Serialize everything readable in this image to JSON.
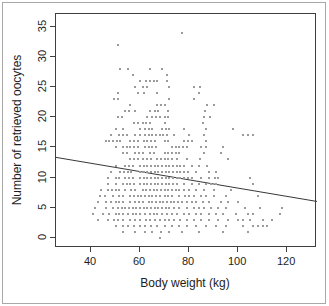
{
  "chart_data": {
    "type": "scatter",
    "title": "",
    "xlabel": "Body weight (kg)",
    "ylabel": "Number of retrieved oocytes",
    "xlim": [
      25.7,
      132.2
    ],
    "ylim": [
      -1.66,
      37.1
    ],
    "x_ticks": [
      40,
      60,
      80,
      100,
      120
    ],
    "y_ticks": [
      0,
      5,
      10,
      15,
      20,
      25,
      30,
      35
    ],
    "grid": false,
    "legend": "none",
    "point_color": "#9b9b9b",
    "trend_color": "#383838",
    "axis_color": "#3f3f3f",
    "frame_color": "#a8a8a8",
    "trend_line": {
      "x": [
        25.7,
        132.2
      ],
      "y": [
        13.35,
        6.05
      ]
    },
    "points": [
      [
        77,
        34
      ],
      [
        51,
        32
      ],
      [
        52,
        28
      ],
      [
        55,
        28
      ],
      [
        64,
        28
      ],
      [
        69,
        28
      ],
      [
        57,
        27
      ],
      [
        71,
        27
      ],
      [
        60,
        26
      ],
      [
        62.5,
        26
      ],
      [
        64,
        26
      ],
      [
        65.5,
        26
      ],
      [
        67,
        26
      ],
      [
        71,
        26
      ],
      [
        58,
        25
      ],
      [
        61,
        25
      ],
      [
        63,
        25
      ],
      [
        72,
        25
      ],
      [
        82,
        25
      ],
      [
        84.5,
        25
      ],
      [
        51,
        24
      ],
      [
        59,
        24
      ],
      [
        61.5,
        24
      ],
      [
        67,
        24
      ],
      [
        84,
        24
      ],
      [
        49.5,
        23
      ],
      [
        51,
        23
      ],
      [
        72,
        23
      ],
      [
        82,
        23
      ],
      [
        56,
        22
      ],
      [
        67,
        22
      ],
      [
        68.5,
        22
      ],
      [
        70,
        22
      ],
      [
        87.5,
        22
      ],
      [
        90,
        22
      ],
      [
        54,
        21
      ],
      [
        55.5,
        21
      ],
      [
        58,
        21
      ],
      [
        64,
        21
      ],
      [
        66,
        21
      ],
      [
        67.5,
        21
      ],
      [
        71.5,
        21
      ],
      [
        86.5,
        21
      ],
      [
        51,
        20
      ],
      [
        52.5,
        20
      ],
      [
        63,
        20
      ],
      [
        65,
        20
      ],
      [
        66.5,
        20
      ],
      [
        68,
        20
      ],
      [
        70,
        20
      ],
      [
        71.5,
        20
      ],
      [
        86,
        20
      ],
      [
        88.5,
        20
      ],
      [
        57.5,
        19
      ],
      [
        59,
        19
      ],
      [
        61,
        19
      ],
      [
        62.5,
        19
      ],
      [
        64,
        19
      ],
      [
        70,
        19
      ],
      [
        85.5,
        19
      ],
      [
        50,
        18
      ],
      [
        53,
        18
      ],
      [
        60,
        18
      ],
      [
        62,
        18
      ],
      [
        63.5,
        18
      ],
      [
        65,
        18
      ],
      [
        69,
        18
      ],
      [
        70.5,
        18
      ],
      [
        72,
        18
      ],
      [
        78,
        18
      ],
      [
        87,
        18
      ],
      [
        98,
        18
      ],
      [
        48,
        17
      ],
      [
        51.5,
        17
      ],
      [
        53,
        17
      ],
      [
        54.5,
        17
      ],
      [
        58,
        17
      ],
      [
        60,
        17
      ],
      [
        62,
        17
      ],
      [
        63.5,
        17
      ],
      [
        65,
        17
      ],
      [
        66.5,
        17
      ],
      [
        68,
        17
      ],
      [
        69.5,
        17
      ],
      [
        71,
        17
      ],
      [
        74,
        17
      ],
      [
        80,
        17
      ],
      [
        86,
        17
      ],
      [
        102,
        17
      ],
      [
        104,
        17
      ],
      [
        106,
        17
      ],
      [
        46,
        16
      ],
      [
        47.5,
        16
      ],
      [
        49,
        16
      ],
      [
        50.5,
        16
      ],
      [
        52,
        16
      ],
      [
        56,
        16
      ],
      [
        57.5,
        16
      ],
      [
        59,
        16
      ],
      [
        61.5,
        16
      ],
      [
        63,
        16
      ],
      [
        64.5,
        16
      ],
      [
        66,
        16
      ],
      [
        70,
        16
      ],
      [
        71.5,
        16
      ],
      [
        78,
        16
      ],
      [
        79.5,
        16
      ],
      [
        81,
        16
      ],
      [
        87,
        16
      ],
      [
        50,
        15
      ],
      [
        53,
        15
      ],
      [
        54.5,
        15
      ],
      [
        56,
        15
      ],
      [
        57.5,
        15
      ],
      [
        59,
        15
      ],
      [
        62,
        15
      ],
      [
        63.5,
        15
      ],
      [
        65,
        15
      ],
      [
        66.5,
        15
      ],
      [
        73,
        15
      ],
      [
        74.5,
        15
      ],
      [
        76,
        15
      ],
      [
        77.5,
        15
      ],
      [
        79,
        15
      ],
      [
        85,
        15
      ],
      [
        87,
        15
      ],
      [
        94,
        15
      ],
      [
        53,
        14
      ],
      [
        54.5,
        14
      ],
      [
        58,
        14
      ],
      [
        59.5,
        14
      ],
      [
        61,
        14
      ],
      [
        64,
        14
      ],
      [
        65.5,
        14
      ],
      [
        70,
        14
      ],
      [
        71.5,
        14
      ],
      [
        73,
        14
      ],
      [
        74.5,
        14
      ],
      [
        76,
        14
      ],
      [
        86,
        14
      ],
      [
        93,
        14
      ],
      [
        56,
        13
      ],
      [
        57.5,
        13
      ],
      [
        59,
        13
      ],
      [
        61,
        13
      ],
      [
        63,
        13
      ],
      [
        64.5,
        13
      ],
      [
        67,
        13
      ],
      [
        68.5,
        13
      ],
      [
        70,
        13
      ],
      [
        71.5,
        13
      ],
      [
        73,
        13
      ],
      [
        75,
        13
      ],
      [
        79,
        13
      ],
      [
        84.5,
        13
      ],
      [
        96,
        13
      ],
      [
        50,
        12
      ],
      [
        54,
        12
      ],
      [
        55.5,
        12
      ],
      [
        57,
        12
      ],
      [
        60,
        12
      ],
      [
        61.5,
        12
      ],
      [
        63,
        12
      ],
      [
        64.5,
        12
      ],
      [
        66,
        12
      ],
      [
        67.5,
        12
      ],
      [
        69,
        12
      ],
      [
        70.5,
        12
      ],
      [
        72,
        12
      ],
      [
        73.5,
        12
      ],
      [
        75,
        12
      ],
      [
        76.5,
        12
      ],
      [
        78,
        12
      ],
      [
        81,
        12
      ],
      [
        84,
        12
      ],
      [
        87.5,
        12
      ],
      [
        48,
        11
      ],
      [
        52,
        11
      ],
      [
        53.5,
        11
      ],
      [
        55,
        11
      ],
      [
        56.5,
        11
      ],
      [
        60,
        11
      ],
      [
        61.5,
        11
      ],
      [
        63,
        11
      ],
      [
        64.5,
        11
      ],
      [
        66,
        11
      ],
      [
        67.5,
        11
      ],
      [
        69,
        11
      ],
      [
        70.5,
        11
      ],
      [
        72,
        11
      ],
      [
        73.5,
        11
      ],
      [
        75,
        11
      ],
      [
        76.5,
        11
      ],
      [
        78,
        11
      ],
      [
        79.5,
        11
      ],
      [
        83,
        11
      ],
      [
        88,
        11
      ],
      [
        91,
        11
      ],
      [
        47,
        10
      ],
      [
        50,
        10
      ],
      [
        51.5,
        10
      ],
      [
        54,
        10
      ],
      [
        55.5,
        10
      ],
      [
        57,
        10
      ],
      [
        60,
        10
      ],
      [
        61.5,
        10
      ],
      [
        63,
        10
      ],
      [
        64.5,
        10
      ],
      [
        66,
        10
      ],
      [
        67.5,
        10
      ],
      [
        69,
        10
      ],
      [
        70.5,
        10
      ],
      [
        72,
        10
      ],
      [
        73.5,
        10
      ],
      [
        75,
        10
      ],
      [
        76.5,
        10
      ],
      [
        78,
        10
      ],
      [
        79.5,
        10
      ],
      [
        81,
        10
      ],
      [
        85,
        10
      ],
      [
        88,
        10
      ],
      [
        90.5,
        10
      ],
      [
        92,
        10
      ],
      [
        105,
        10
      ],
      [
        47,
        9
      ],
      [
        50,
        9
      ],
      [
        53,
        9
      ],
      [
        54.5,
        9
      ],
      [
        56,
        9
      ],
      [
        57.5,
        9
      ],
      [
        60,
        9
      ],
      [
        61.5,
        9
      ],
      [
        63,
        9
      ],
      [
        64.5,
        9
      ],
      [
        66,
        9
      ],
      [
        67.5,
        9
      ],
      [
        69,
        9
      ],
      [
        70.5,
        9
      ],
      [
        72,
        9
      ],
      [
        73.5,
        9
      ],
      [
        75,
        9
      ],
      [
        78,
        9
      ],
      [
        81,
        9
      ],
      [
        84,
        9
      ],
      [
        87,
        9
      ],
      [
        89,
        9
      ],
      [
        91,
        9
      ],
      [
        106,
        9
      ],
      [
        44,
        8
      ],
      [
        47,
        8
      ],
      [
        48.5,
        8
      ],
      [
        50,
        8
      ],
      [
        51.5,
        8
      ],
      [
        54,
        8
      ],
      [
        56.5,
        8
      ],
      [
        58,
        8
      ],
      [
        61,
        8
      ],
      [
        62.5,
        8
      ],
      [
        64,
        8
      ],
      [
        65.5,
        8
      ],
      [
        67,
        8
      ],
      [
        68.5,
        8
      ],
      [
        70,
        8
      ],
      [
        71.5,
        8
      ],
      [
        73,
        8
      ],
      [
        74.5,
        8
      ],
      [
        76,
        8
      ],
      [
        78,
        8
      ],
      [
        80,
        8
      ],
      [
        83,
        8
      ],
      [
        86,
        8
      ],
      [
        90,
        8
      ],
      [
        97,
        8
      ],
      [
        43.5,
        7
      ],
      [
        45.5,
        7
      ],
      [
        49,
        7
      ],
      [
        51.5,
        7
      ],
      [
        53,
        7
      ],
      [
        56,
        7
      ],
      [
        57.5,
        7
      ],
      [
        59,
        7
      ],
      [
        60.5,
        7
      ],
      [
        62,
        7
      ],
      [
        63.5,
        7
      ],
      [
        65,
        7
      ],
      [
        66.5,
        7
      ],
      [
        68,
        7
      ],
      [
        70,
        7
      ],
      [
        71.5,
        7
      ],
      [
        73,
        7
      ],
      [
        76,
        7
      ],
      [
        78.5,
        7
      ],
      [
        80,
        7
      ],
      [
        82,
        7
      ],
      [
        85,
        7
      ],
      [
        87,
        7
      ],
      [
        90,
        7
      ],
      [
        95,
        7
      ],
      [
        108,
        7
      ],
      [
        43,
        6
      ],
      [
        46,
        6
      ],
      [
        48,
        6
      ],
      [
        50,
        6
      ],
      [
        51.5,
        6
      ],
      [
        53,
        6
      ],
      [
        56,
        6
      ],
      [
        58,
        6
      ],
      [
        59.5,
        6
      ],
      [
        61,
        6
      ],
      [
        63.5,
        6
      ],
      [
        65,
        6
      ],
      [
        66.5,
        6
      ],
      [
        68,
        6
      ],
      [
        69.5,
        6
      ],
      [
        71,
        6
      ],
      [
        72.5,
        6
      ],
      [
        74,
        6
      ],
      [
        75.5,
        6
      ],
      [
        77,
        6
      ],
      [
        79,
        6
      ],
      [
        81,
        6
      ],
      [
        83,
        6
      ],
      [
        85.5,
        6
      ],
      [
        88,
        6
      ],
      [
        93,
        6
      ],
      [
        96,
        6
      ],
      [
        100,
        6
      ],
      [
        41.5,
        5
      ],
      [
        46,
        5
      ],
      [
        49,
        5
      ],
      [
        51,
        5
      ],
      [
        52.5,
        5
      ],
      [
        54,
        5
      ],
      [
        55.5,
        5
      ],
      [
        57,
        5
      ],
      [
        58.5,
        5
      ],
      [
        60,
        5
      ],
      [
        61.5,
        5
      ],
      [
        63,
        5
      ],
      [
        64.5,
        5
      ],
      [
        66,
        5
      ],
      [
        67.5,
        5
      ],
      [
        69,
        5
      ],
      [
        70.5,
        5
      ],
      [
        72,
        5
      ],
      [
        74,
        5
      ],
      [
        76,
        5
      ],
      [
        79,
        5
      ],
      [
        82,
        5
      ],
      [
        84,
        5
      ],
      [
        86,
        5
      ],
      [
        89,
        5
      ],
      [
        92,
        5
      ],
      [
        95,
        5
      ],
      [
        103,
        5
      ],
      [
        109,
        5
      ],
      [
        118,
        5
      ],
      [
        41,
        4
      ],
      [
        45,
        4
      ],
      [
        47.5,
        4
      ],
      [
        50,
        4
      ],
      [
        51.5,
        4
      ],
      [
        53,
        4
      ],
      [
        55,
        4
      ],
      [
        57,
        4
      ],
      [
        58.5,
        4
      ],
      [
        60,
        4
      ],
      [
        62,
        4
      ],
      [
        64,
        4
      ],
      [
        65.5,
        4
      ],
      [
        67,
        4
      ],
      [
        69,
        4
      ],
      [
        71,
        4
      ],
      [
        73,
        4
      ],
      [
        75,
        4
      ],
      [
        78,
        4
      ],
      [
        80,
        4
      ],
      [
        83,
        4
      ],
      [
        85,
        4
      ],
      [
        88,
        4
      ],
      [
        91,
        4
      ],
      [
        94,
        4
      ],
      [
        99,
        4
      ],
      [
        104,
        4
      ],
      [
        106,
        4
      ],
      [
        117,
        4
      ],
      [
        43,
        3
      ],
      [
        47,
        3
      ],
      [
        49.5,
        3
      ],
      [
        51,
        3
      ],
      [
        53,
        3
      ],
      [
        56,
        3
      ],
      [
        58,
        3
      ],
      [
        60,
        3
      ],
      [
        62.5,
        3
      ],
      [
        64,
        3
      ],
      [
        66,
        3
      ],
      [
        68,
        3
      ],
      [
        70,
        3
      ],
      [
        72,
        3
      ],
      [
        74,
        3
      ],
      [
        76.5,
        3
      ],
      [
        79,
        3
      ],
      [
        82,
        3
      ],
      [
        85,
        3
      ],
      [
        88,
        3
      ],
      [
        92,
        3
      ],
      [
        96,
        3
      ],
      [
        100,
        3
      ],
      [
        102,
        3
      ],
      [
        105,
        3
      ],
      [
        110,
        3
      ],
      [
        114,
        3
      ],
      [
        50,
        2
      ],
      [
        53,
        2
      ],
      [
        55,
        2
      ],
      [
        57.5,
        2
      ],
      [
        60,
        2
      ],
      [
        62,
        2
      ],
      [
        64.5,
        2
      ],
      [
        67,
        2
      ],
      [
        70,
        2
      ],
      [
        73,
        2
      ],
      [
        76,
        2
      ],
      [
        79,
        2
      ],
      [
        83,
        2
      ],
      [
        87,
        2
      ],
      [
        91,
        2
      ],
      [
        95,
        2
      ],
      [
        102,
        2
      ],
      [
        106,
        2
      ],
      [
        108,
        2
      ],
      [
        110,
        2
      ],
      [
        112,
        2
      ],
      [
        53,
        1
      ],
      [
        58,
        1
      ],
      [
        62,
        1
      ],
      [
        65,
        1
      ],
      [
        68.5,
        1
      ],
      [
        72,
        1
      ],
      [
        77,
        1
      ],
      [
        84,
        1
      ],
      [
        94,
        1
      ],
      [
        104,
        1
      ],
      [
        68,
        0
      ]
    ]
  }
}
